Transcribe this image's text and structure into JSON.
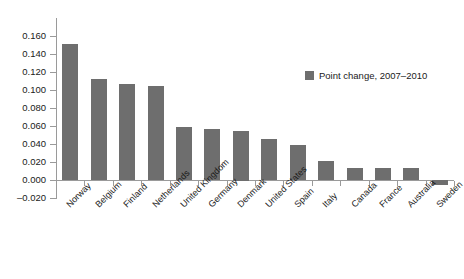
{
  "chart_data": {
    "type": "bar",
    "title": "",
    "subtitle": "",
    "xlabel": "",
    "ylabel": "",
    "categories": [
      "Norway",
      "Belgium",
      "Finland",
      "Netherlands",
      "United Kingdom",
      "Germany",
      "Denmark",
      "United States",
      "Spain",
      "Italy",
      "Canada",
      "France",
      "Australia",
      "Sweden"
    ],
    "series": [
      {
        "name": "Point change, 2007–2010",
        "color": "#6e6e6e",
        "values": [
          0.151,
          0.112,
          0.107,
          0.104,
          0.059,
          0.057,
          0.055,
          0.046,
          0.039,
          0.021,
          0.013,
          0.013,
          0.013,
          -0.006
        ]
      }
    ],
    "ylim": [
      -0.02,
      0.16
    ],
    "ytick_values": [
      0.16,
      0.14,
      0.12,
      0.1,
      0.08,
      0.06,
      0.04,
      0.02,
      0.0,
      -0.02
    ],
    "ytick_labels": [
      "0.160",
      "0.140",
      "0.120",
      "0.100",
      "0.080",
      "0.060",
      "0.040",
      "0.020",
      "0.000",
      "–0.020"
    ],
    "grid": false,
    "legend_position": "upper-right",
    "legend_entries": [
      "Point change, 2007–2010"
    ],
    "annotations": []
  },
  "legend": {
    "label": "Point change, 2007–2010"
  }
}
